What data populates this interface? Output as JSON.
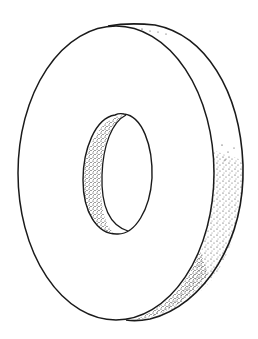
{
  "illustration": {
    "subject": "washer / flat ring drawn in perspective",
    "style": "black ink line drawing with stippled shading",
    "colors": {
      "background": "#ffffff",
      "ink": "#1a1a1a"
    }
  }
}
